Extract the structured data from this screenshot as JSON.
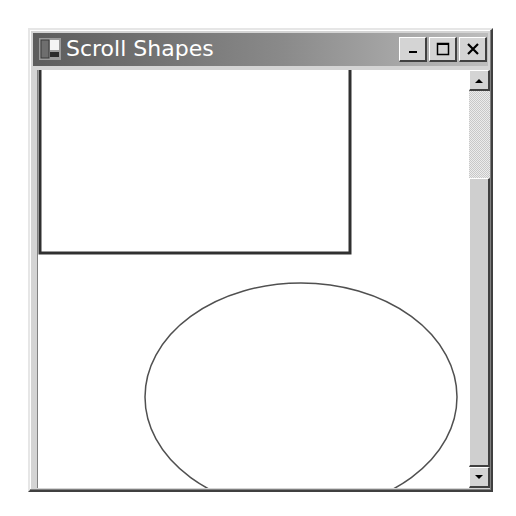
{
  "window": {
    "title": "Scroll Shapes",
    "icon": "app-window-icon",
    "controls": [
      {
        "name": "minimize-button",
        "icon": "minimize-icon"
      },
      {
        "name": "maximize-button",
        "icon": "maximize-icon"
      },
      {
        "name": "close-button",
        "icon": "close-icon"
      }
    ]
  },
  "canvas": {
    "shapes": [
      {
        "type": "rectangle",
        "x": 0,
        "y": -20,
        "width": 312,
        "height": 203,
        "stroke": "#303030",
        "stroke_width": 3
      },
      {
        "type": "ellipse",
        "cx": 263,
        "cy": 327,
        "rx": 156,
        "ry": 114,
        "stroke": "#505050",
        "stroke_width": 1.5
      }
    ]
  },
  "scrollbar": {
    "orientation": "vertical",
    "up_icon": "scroll-up-arrow-icon",
    "down_icon": "scroll-down-arrow-icon"
  }
}
